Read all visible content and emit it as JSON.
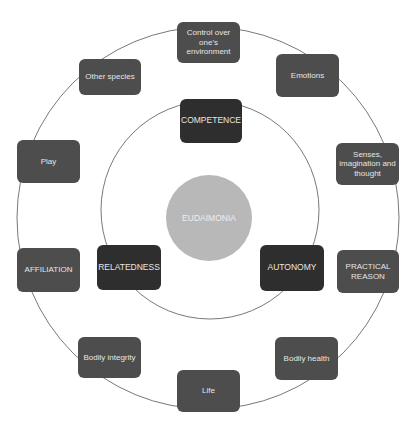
{
  "diagram": {
    "center": {
      "label": "EUDAIMONIA",
      "color": "#b8b8b8"
    },
    "inner_ring": [
      {
        "label": "COMPETENCE"
      },
      {
        "label": "RELATEDNESS"
      },
      {
        "label": "AUTONOMY"
      }
    ],
    "outer_ring": [
      {
        "label": "Control over one's environment"
      },
      {
        "label": "Emotions"
      },
      {
        "label": "Senses, imagination and thought"
      },
      {
        "label": "PRACTICAL REASON"
      },
      {
        "label": "Bodily health"
      },
      {
        "label": "Life"
      },
      {
        "label": "Bodily integrity"
      },
      {
        "label": "AFFILIATION"
      },
      {
        "label": "Play"
      },
      {
        "label": "Other species"
      }
    ],
    "colors": {
      "outer_box": "#4d4d4d",
      "inner_box": "#2e2e2e",
      "ring_line": "#555555"
    }
  }
}
